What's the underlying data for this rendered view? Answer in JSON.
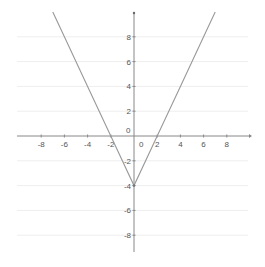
{
  "chart_data": {
    "type": "line",
    "title": "",
    "xlabel": "",
    "ylabel": "",
    "function": "y = 2|x| - 4",
    "series": [
      {
        "name": "y = 2|x| - 4",
        "x": [
          -7,
          -6,
          -4,
          -2,
          0,
          2,
          4,
          6,
          7
        ],
        "y": [
          10,
          8,
          4,
          0,
          -4,
          0,
          4,
          8,
          10
        ],
        "color": "#999999"
      }
    ],
    "vertex": {
      "x": 0,
      "y": -4
    },
    "x_intercepts": [
      -2,
      2
    ],
    "y_intercept": -4,
    "xlim": [
      -10,
      10
    ],
    "ylim": [
      -10,
      10
    ],
    "x_ticks": [
      -8,
      -6,
      -4,
      -2,
      0,
      2,
      4,
      6,
      8
    ],
    "y_ticks": [
      -8,
      -6,
      -4,
      -2,
      0,
      2,
      4,
      6,
      8
    ],
    "x_tick_labels": [
      "-8",
      "-6",
      "-4",
      "-2",
      "0",
      "2",
      "4",
      "6",
      "8"
    ],
    "y_tick_labels": [
      "-8",
      "-6",
      "-4",
      "-2",
      "0",
      "2",
      "4",
      "6",
      "8"
    ],
    "grid": true,
    "grid_color": "#eeeeee",
    "axis_color": "#888888",
    "legend": null
  }
}
